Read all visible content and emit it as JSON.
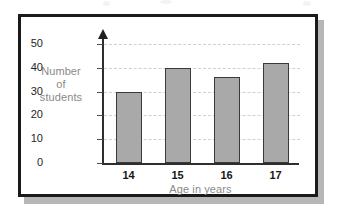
{
  "chart_data": {
    "type": "bar",
    "title": "",
    "subtitle": "",
    "categories": [
      "14",
      "15",
      "16",
      "17"
    ],
    "values": [
      30,
      40,
      36,
      42
    ],
    "series": [
      {
        "name": "Number of students",
        "values": [
          30,
          40,
          36,
          42
        ]
      }
    ],
    "xlabel": "Age in years",
    "ylabel": "Number of students",
    "ylabel_lines": [
      "Number",
      "of",
      "students"
    ],
    "ylim": [
      0,
      50
    ],
    "ytick_labels": [
      "0",
      "10",
      "20",
      "30",
      "40",
      "50"
    ],
    "ytick_values": [
      0,
      10,
      20,
      30,
      40,
      50
    ],
    "xtick_labels": [
      "14",
      "15",
      "16",
      "17"
    ],
    "grid": "horizontal-dashed",
    "legend": "none",
    "colors": {
      "bar_fill": "#a9a9a9",
      "bar_stroke": "#3a3a3a",
      "axis": "#2e2e2e",
      "gridline": "#cfcfd4",
      "label_gray": "#8a8a8a",
      "tick_text": "#1f1f1f",
      "frame_border": "#1a1a1a",
      "frame_shadow": "#b6b6b6",
      "background": "#ffffff"
    }
  }
}
